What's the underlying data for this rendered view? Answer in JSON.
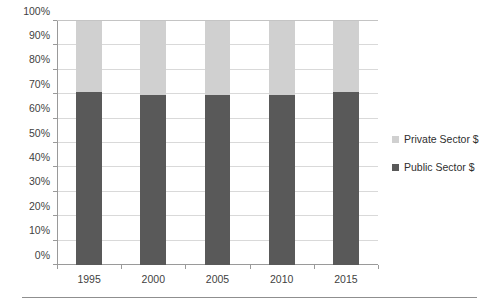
{
  "chart_data": {
    "type": "bar",
    "subtype": "stacked-percent-column",
    "title": "",
    "xlabel": "",
    "ylabel": "",
    "categories": [
      "1995",
      "2000",
      "2005",
      "2010",
      "2015"
    ],
    "series": [
      {
        "name": "Public Sector $",
        "color": "#595959",
        "values": [
          71,
          69.5,
          69.5,
          69.5,
          70.8
        ]
      },
      {
        "name": "Private Sector $",
        "color": "#d0d0d0",
        "values": [
          29,
          30.5,
          30.5,
          30.5,
          29.2
        ]
      }
    ],
    "ylim": [
      0,
      100
    ],
    "ytick_values": [
      0,
      10,
      20,
      30,
      40,
      50,
      60,
      70,
      80,
      90,
      100
    ],
    "ytick_labels": [
      "0%",
      "10%",
      "20%",
      "30%",
      "40%",
      "50%",
      "60%",
      "70%",
      "80%",
      "90%",
      "100%"
    ],
    "grid": true,
    "grid_axis": "y",
    "legend_position": "right",
    "legend_entries": [
      "Private Sector $",
      "Public Sector $"
    ],
    "value_suffix": "%"
  },
  "legend": {
    "items": [
      {
        "label": "Private Sector $",
        "swatch": "legend-swatch-private"
      },
      {
        "label": "Public Sector $",
        "swatch": "legend-swatch-public"
      }
    ]
  },
  "colors": {
    "public_sector": "#595959",
    "private_sector": "#d0d0d0",
    "gridline": "#d9d9d9",
    "axis": "#9a9a9a",
    "text": "#3f3f3f",
    "background": "#ffffff"
  }
}
